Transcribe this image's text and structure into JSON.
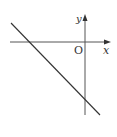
{
  "diagram": {
    "type": "coordinate-plane-line",
    "axes": {
      "x_label": "x",
      "y_label": "y",
      "origin_label": "O"
    },
    "line": {
      "description": "straight line with negative slope, negative x-intercept and negative y-intercept"
    },
    "colors": {
      "axis": "#555555",
      "line": "#333333",
      "background": "#ffffff"
    }
  }
}
